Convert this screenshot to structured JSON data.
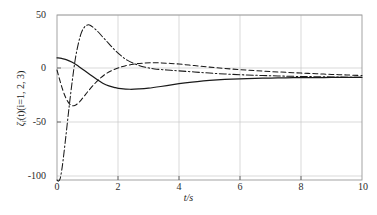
{
  "figure": {
    "background": "#ffffff",
    "frame_color": "#9a9a9a",
    "grid_color": "#c8c8c8",
    "curve_color": "#1a1a1a"
  },
  "axes": {
    "x_ticks": [
      "0",
      "2",
      "4",
      "6",
      "8",
      "10"
    ],
    "y_ticks": [
      "50",
      "0",
      "-50",
      "-100"
    ],
    "x_label": "t/s",
    "y_label_parts": {
      "zeta": "ζ",
      "sub_i": "i",
      "rest": "(t)(i=1, 2, 3)"
    },
    "y_label_plain": "ζi(t)(i=1, 2, 3)"
  },
  "chart_data": {
    "type": "line",
    "title": "",
    "xlabel": "t/s",
    "ylabel": "ζi(t)(i=1, 2, 3)",
    "xlim": [
      0,
      10
    ],
    "ylim": [
      -100,
      50
    ],
    "xticks": [
      0,
      2,
      4,
      6,
      8,
      10
    ],
    "yticks": [
      -100,
      -50,
      0,
      50
    ],
    "grid": true,
    "legend": "none",
    "series": [
      {
        "name": "ζ1(t)",
        "style": "solid",
        "x": [
          0,
          0.15,
          0.3,
          0.5,
          0.7,
          0.9,
          1.1,
          1.3,
          1.5,
          1.7,
          1.9,
          2.1,
          2.4,
          2.7,
          3.0,
          3.4,
          3.8,
          4.2,
          4.6,
          5.0,
          5.5,
          6.0,
          6.5,
          7.0,
          7.5,
          8.0,
          8.5,
          9.0,
          9.5,
          10.0
        ],
        "y": [
          11,
          10.5,
          9.5,
          7.0,
          3.5,
          -0.5,
          -4.5,
          -8.5,
          -12.0,
          -14.5,
          -16.0,
          -17.0,
          -17.5,
          -17.2,
          -16.5,
          -15.0,
          -13.3,
          -11.8,
          -10.5,
          -9.5,
          -8.6,
          -8.0,
          -7.6,
          -7.3,
          -7.1,
          -7.0,
          -6.9,
          -6.8,
          -6.7,
          -6.6
        ]
      },
      {
        "name": "ζ2(t)",
        "style": "dashed",
        "x": [
          0,
          0.1,
          0.2,
          0.3,
          0.4,
          0.5,
          0.6,
          0.7,
          0.8,
          0.9,
          1.0,
          1.2,
          1.4,
          1.6,
          1.8,
          2.0,
          2.2,
          2.5,
          2.8,
          3.2,
          3.6,
          4.0,
          4.5,
          5.0,
          5.5,
          6.0,
          6.5,
          7.0,
          7.5,
          8.0,
          8.5,
          9.0,
          9.5,
          10.0
        ],
        "y": [
          0,
          -10,
          -19,
          -26,
          -30.5,
          -32.5,
          -32.0,
          -30.0,
          -27.0,
          -23.5,
          -20.0,
          -13.5,
          -8.0,
          -3.5,
          -0.5,
          1.8,
          3.5,
          5.3,
          6.2,
          6.6,
          6.2,
          5.4,
          4.0,
          2.6,
          1.4,
          0.3,
          -0.6,
          -1.4,
          -2.1,
          -2.8,
          -3.4,
          -4.0,
          -4.5,
          -5.0
        ]
      },
      {
        "name": "ζ3(t)",
        "style": "dashdot",
        "x": [
          0,
          0.05,
          0.1,
          0.15,
          0.2,
          0.3,
          0.4,
          0.5,
          0.6,
          0.7,
          0.8,
          0.9,
          1.0,
          1.1,
          1.3,
          1.5,
          1.7,
          1.9,
          2.1,
          2.3,
          2.6,
          2.9,
          3.2,
          3.6,
          4.0,
          4.5,
          5.0,
          5.5,
          6.0,
          6.5,
          7.0,
          7.5,
          8.0,
          8.5,
          9.0,
          9.5,
          10.0
        ],
        "y": [
          -100,
          -101,
          -99,
          -92,
          -82,
          -58,
          -33,
          -10,
          10,
          24,
          34,
          39,
          41,
          40.5,
          36,
          30,
          24,
          18,
          13,
          9,
          5,
          2.5,
          1.0,
          0.0,
          -0.8,
          -1.8,
          -2.8,
          -3.6,
          -4.3,
          -4.8,
          -5.2,
          -5.6,
          -5.9,
          -6.1,
          -6.3,
          -6.5,
          -6.6
        ]
      }
    ]
  }
}
